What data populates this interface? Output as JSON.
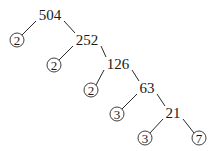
{
  "diagram": {
    "type": "factor-tree",
    "root": "504",
    "nodes": [
      {
        "id": "n504",
        "label": "504",
        "x": 50,
        "y": 15,
        "prime": false
      },
      {
        "id": "p1",
        "label": "2",
        "x": 17,
        "y": 40,
        "prime": true
      },
      {
        "id": "n252",
        "label": "252",
        "x": 87,
        "y": 40,
        "prime": false
      },
      {
        "id": "p2",
        "label": "2",
        "x": 54,
        "y": 65,
        "prime": true
      },
      {
        "id": "n126",
        "label": "126",
        "x": 118,
        "y": 64,
        "prime": false
      },
      {
        "id": "p3",
        "label": "2",
        "x": 91,
        "y": 90,
        "prime": true
      },
      {
        "id": "n63",
        "label": "63",
        "x": 147,
        "y": 88,
        "prime": false
      },
      {
        "id": "p4",
        "label": "3",
        "x": 117,
        "y": 114,
        "prime": true
      },
      {
        "id": "n21",
        "label": "21",
        "x": 173,
        "y": 113,
        "prime": false
      },
      {
        "id": "p5",
        "label": "3",
        "x": 145,
        "y": 138,
        "prime": true
      },
      {
        "id": "p6",
        "label": "7",
        "x": 199,
        "y": 138,
        "prime": true
      }
    ],
    "edges": [
      {
        "from": "n504",
        "to": "p1"
      },
      {
        "from": "n504",
        "to": "n252"
      },
      {
        "from": "n252",
        "to": "p2"
      },
      {
        "from": "n252",
        "to": "n126"
      },
      {
        "from": "n126",
        "to": "p3"
      },
      {
        "from": "n126",
        "to": "n63"
      },
      {
        "from": "n63",
        "to": "p4"
      },
      {
        "from": "n63",
        "to": "n21"
      },
      {
        "from": "n21",
        "to": "p5"
      },
      {
        "from": "n21",
        "to": "p6"
      }
    ],
    "prime_factors": [
      "2",
      "2",
      "2",
      "3",
      "3",
      "7"
    ]
  }
}
